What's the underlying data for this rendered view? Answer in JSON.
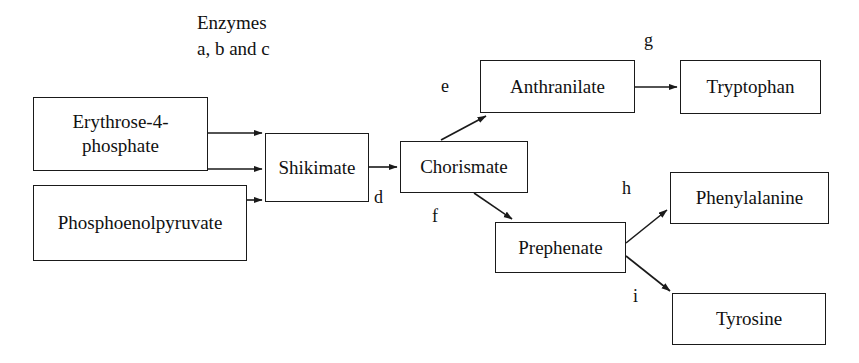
{
  "diagram": {
    "title_caption": {
      "text": "Enzymes\na, b and c",
      "x": 197,
      "y": 10
    },
    "nodes": [
      {
        "id": "erythrose-4-phosphate",
        "label": "Erythrose-4-\nphosphate",
        "x": 33,
        "y": 97,
        "width": 175,
        "height": 74
      },
      {
        "id": "phosphoenolpyruvate",
        "label": "Phosphoenolpyruvate",
        "x": 33,
        "y": 185,
        "width": 214,
        "height": 76
      },
      {
        "id": "shikimate",
        "label": "Shikimate",
        "x": 265,
        "y": 133,
        "width": 104,
        "height": 69
      },
      {
        "id": "chorismate",
        "label": "Chorismate",
        "x": 400,
        "y": 141,
        "width": 128,
        "height": 52
      },
      {
        "id": "anthranilate",
        "label": "Anthranilate",
        "x": 480,
        "y": 60,
        "width": 155,
        "height": 53
      },
      {
        "id": "prephenate",
        "label": "Prephenate",
        "x": 495,
        "y": 222,
        "width": 131,
        "height": 51
      },
      {
        "id": "tryptophan",
        "label": "Tryptophan",
        "x": 680,
        "y": 60,
        "width": 141,
        "height": 54
      },
      {
        "id": "phenylalanine",
        "label": "Phenylalanine",
        "x": 670,
        "y": 172,
        "width": 159,
        "height": 52
      },
      {
        "id": "tyrosine",
        "label": "Tyrosine",
        "x": 672,
        "y": 293,
        "width": 154,
        "height": 52
      }
    ],
    "edge_labels": [
      {
        "id": "d",
        "text": "d",
        "x": 374,
        "y": 188
      },
      {
        "id": "e",
        "text": "e",
        "x": 441,
        "y": 77
      },
      {
        "id": "f",
        "text": "f",
        "x": 432,
        "y": 207
      },
      {
        "id": "g",
        "text": "g",
        "x": 644,
        "y": 31
      },
      {
        "id": "h",
        "text": "h",
        "x": 622,
        "y": 179
      },
      {
        "id": "i",
        "text": "i",
        "x": 633,
        "y": 287
      }
    ],
    "edges": [
      {
        "id": "erythrose-to-shikimate-a",
        "from": "erythrose-4-phosphate",
        "to": "shikimate",
        "enzyme": "a"
      },
      {
        "id": "erythrose-to-shikimate-b",
        "from": "erythrose-4-phosphate",
        "to": "shikimate",
        "enzyme": "b"
      },
      {
        "id": "pep-to-shikimate-c",
        "from": "phosphoenolpyruvate",
        "to": "shikimate",
        "enzyme": "c"
      },
      {
        "id": "shikimate-to-chorismate",
        "from": "shikimate",
        "to": "chorismate",
        "enzyme": "d"
      },
      {
        "id": "chorismate-to-anthranilate",
        "from": "chorismate",
        "to": "anthranilate",
        "enzyme": "e"
      },
      {
        "id": "chorismate-to-prephenate",
        "from": "chorismate",
        "to": "prephenate",
        "enzyme": "f"
      },
      {
        "id": "anthranilate-to-tryptophan",
        "from": "anthranilate",
        "to": "tryptophan",
        "enzyme": "g"
      },
      {
        "id": "prephenate-to-phenylalanine",
        "from": "prephenate",
        "to": "phenylalanine",
        "enzyme": "h"
      },
      {
        "id": "prephenate-to-tyrosine",
        "from": "prephenate",
        "to": "tyrosine",
        "enzyme": "i"
      }
    ],
    "colors": {
      "stroke": "#1a1a1a",
      "text": "#111111",
      "background": "#ffffff"
    }
  }
}
